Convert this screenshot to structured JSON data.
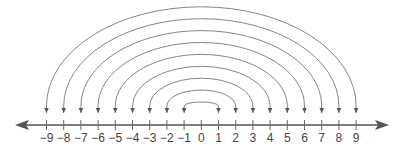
{
  "diagram": {
    "type": "number-line-with-opposite-pair-arcs",
    "axis": {
      "min": -9,
      "max": 9,
      "step": 1,
      "arrows": "both",
      "color": "#555555"
    },
    "tick_labels": [
      "−9",
      "−8",
      "−7",
      "−6",
      "−5",
      "−4",
      "−3",
      "−2",
      "−1",
      "0",
      "1",
      "2",
      "3",
      "4",
      "5",
      "6",
      "7",
      "8",
      "9"
    ],
    "arcs": [
      {
        "from": -1,
        "to": 1
      },
      {
        "from": -2,
        "to": 2
      },
      {
        "from": -3,
        "to": 3
      },
      {
        "from": -4,
        "to": 4
      },
      {
        "from": -5,
        "to": 5
      },
      {
        "from": -6,
        "to": 6
      },
      {
        "from": -7,
        "to": 7
      },
      {
        "from": -8,
        "to": 8
      },
      {
        "from": -9,
        "to": 9
      }
    ],
    "arc_color": "#777777"
  }
}
